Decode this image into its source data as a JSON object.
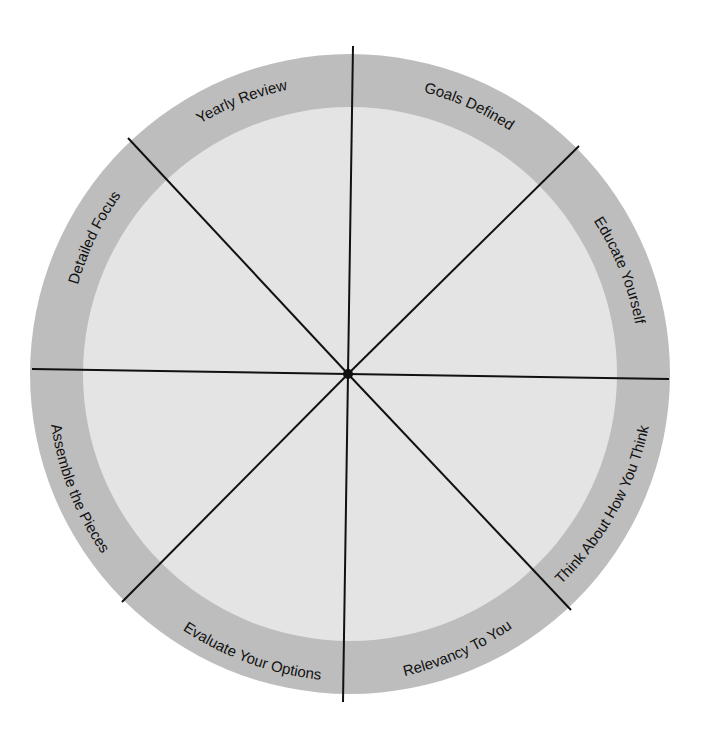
{
  "diagram": {
    "type": "segmented-wheel",
    "colors": {
      "background": "#ffffff",
      "ring": "#bdbdbd",
      "inner": "#e4e4e4",
      "lines": "#111111",
      "text": "#111111"
    },
    "segments": [
      {
        "label": "Goals Defined"
      },
      {
        "label": "Educate Yourself"
      },
      {
        "label": "Think About How You Think"
      },
      {
        "label": "Relevancy To You"
      },
      {
        "label": "Evaluate Your Options"
      },
      {
        "label": "Assemble the Pieces"
      },
      {
        "label": "Detailed Focus"
      },
      {
        "label": "Yearly Review"
      }
    ]
  }
}
